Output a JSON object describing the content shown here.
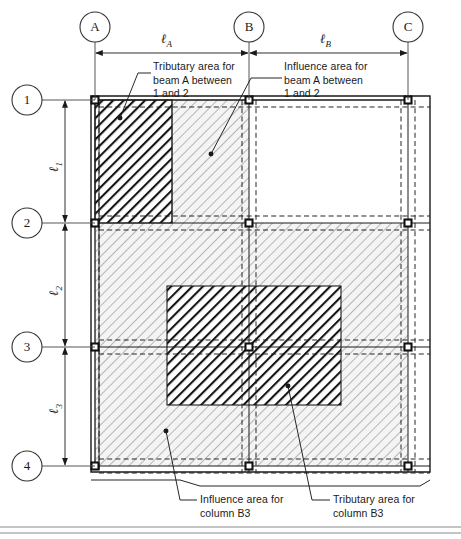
{
  "figure": {
    "type": "structural-framing-plan"
  },
  "grid": {
    "column_lines": [
      {
        "id": "A",
        "label": "A",
        "x": 95
      },
      {
        "id": "B",
        "label": "B",
        "x": 249
      },
      {
        "id": "C",
        "label": "C",
        "x": 408
      }
    ],
    "row_lines": [
      {
        "id": "1",
        "label": "1",
        "y": 100
      },
      {
        "id": "2",
        "label": "2",
        "y": 223
      },
      {
        "id": "3",
        "label": "3",
        "y": 347
      },
      {
        "id": "4",
        "label": "4",
        "y": 466
      }
    ]
  },
  "dimensions": {
    "horizontal": [
      {
        "label": "ℓ",
        "sub": "A",
        "from": "A",
        "to": "B"
      },
      {
        "label": "ℓ",
        "sub": "B",
        "from": "B",
        "to": "C"
      }
    ],
    "vertical": [
      {
        "label": "ℓ",
        "sub": "1",
        "from": "1",
        "to": "2"
      },
      {
        "label": "ℓ",
        "sub": "2",
        "from": "2",
        "to": "3"
      },
      {
        "label": "ℓ",
        "sub": "3",
        "from": "3",
        "to": "4"
      }
    ]
  },
  "annotations": {
    "tributary_beam": {
      "text": "Tributary area for\nbeam A between\n1 and 2"
    },
    "influence_beam": {
      "text": "Influence area for\nbeam A between\n1 and 2"
    },
    "influence_column": {
      "text": "Influence area for\ncolumn B3"
    },
    "tributary_column": {
      "text": "Tributary area for\ncolumn B3"
    }
  },
  "areas": {
    "tributary_beam_a_1_2": {
      "fill": "dark-hatch",
      "x": 95,
      "y": 100,
      "width": 77,
      "height": 123
    },
    "influence_beam_a_1_2": {
      "fill": "light-hatch",
      "x": 95,
      "y": 100,
      "width": 154,
      "height": 123
    },
    "influence_column_b3": {
      "fill": "light-hatch",
      "x": 95,
      "y": 223,
      "width": 313,
      "height": 243
    },
    "tributary_column_b3": {
      "fill": "dark-hatch",
      "x": 167,
      "y": 286,
      "width": 174,
      "height": 119
    }
  },
  "colors": {
    "line": "#1a1a1a",
    "light_hatch": "#b9b9b9",
    "light_fill": "#f2f2f2",
    "dark_hatch": "#141414",
    "background": "#ffffff",
    "column_fill": "#ffffff"
  }
}
